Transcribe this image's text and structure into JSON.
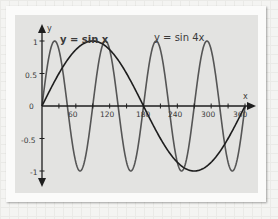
{
  "chart_data": {
    "type": "line",
    "title": "",
    "xlabel": "x",
    "ylabel": "y",
    "xlim": [
      0,
      360
    ],
    "ylim": [
      -1,
      1
    ],
    "x_ticks": [
      60,
      120,
      180,
      240,
      300,
      360
    ],
    "x_tick_labels": [
      "60",
      "120",
      "180",
      "240",
      "300",
      "360"
    ],
    "y_ticks": [
      -1,
      -0.5,
      0,
      0.5,
      1
    ],
    "y_tick_labels": [
      "-1",
      "-0.5",
      "0",
      "0.5",
      "1"
    ],
    "grid": false,
    "series": [
      {
        "name": "y = sin x",
        "function": "sin(x)",
        "color": "#1e1e1e",
        "x": [
          0,
          30,
          60,
          90,
          120,
          150,
          180,
          210,
          240,
          270,
          300,
          330,
          360
        ],
        "values": [
          0,
          0.5,
          0.866,
          1,
          0.866,
          0.5,
          0,
          -0.5,
          -0.866,
          -1,
          -0.866,
          -0.5,
          0
        ]
      },
      {
        "name": "y = sin 4x",
        "function": "sin(4x)",
        "color": "#555555",
        "x": [
          0,
          22.5,
          45,
          67.5,
          90,
          112.5,
          135,
          157.5,
          180,
          202.5,
          225,
          247.5,
          270,
          292.5,
          315,
          337.5,
          360
        ],
        "values": [
          0,
          1,
          0,
          -1,
          0,
          1,
          0,
          -1,
          0,
          1,
          0,
          -1,
          0,
          1,
          0,
          -1,
          0
        ]
      }
    ],
    "annotations": [
      {
        "text": "y = sin x",
        "position": "upper-left, near x≈60"
      },
      {
        "text": "y = sin 4x",
        "position": "upper-middle, near x≈200"
      }
    ]
  },
  "labels": {
    "x_axis": "x",
    "y_axis": "y",
    "sinx": "y = sin x",
    "sin4x": "y = sin 4x",
    "origin": "0",
    "y_1": "1",
    "y_05": "0.5",
    "y_m05": "-0.5",
    "y_m1": "-1",
    "x_60": "60",
    "x_120": "120",
    "x_180": "180",
    "x_240": "240",
    "x_300": "300",
    "x_360": "360"
  }
}
